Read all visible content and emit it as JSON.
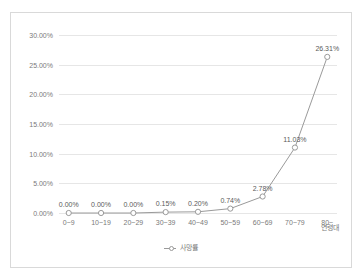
{
  "chart_data": {
    "type": "line",
    "title": "",
    "subtitle": "",
    "xlabel": "연령대",
    "ylabel": "",
    "categories": [
      "0~9",
      "10~19",
      "20~29",
      "30~39",
      "40~49",
      "50~59",
      "60~69",
      "70~79",
      "80~"
    ],
    "series": [
      {
        "name": "사망률",
        "values": [
          0.0,
          0.0,
          0.0,
          0.15,
          0.2,
          0.74,
          2.78,
          11.03,
          26.31
        ],
        "value_labels": [
          "0.00%",
          "0.00%",
          "0.00%",
          "0.15%",
          "0.20%",
          "0.74%",
          "2.78%",
          "11.03%",
          "26.31%"
        ],
        "color": "#9a9a9a",
        "marker": "open-circle"
      }
    ],
    "ylim": [
      0,
      30
    ],
    "ytick_values": [
      0,
      5,
      10,
      15,
      20,
      25,
      30
    ],
    "ytick_labels": [
      "0.00%",
      "5.00%",
      "10.00%",
      "15.00%",
      "20.00%",
      "25.00%",
      "30.00%"
    ],
    "grid": "horizontal",
    "legend_position": "bottom",
    "data_labels_shown": true
  },
  "legend": {
    "entries": [
      {
        "label": "사망률"
      }
    ]
  },
  "axis": {
    "x_title": "연령대"
  },
  "colors": {
    "line": "#9a9a9a",
    "marker_stroke": "#9a9a9a",
    "marker_fill": "#ffffff",
    "gridline": "#e6e6e6",
    "tick_text": "#7a7a7a",
    "label_text": "#5a5a5a",
    "card_border": "#d9d9d9",
    "background": "#ffffff"
  }
}
